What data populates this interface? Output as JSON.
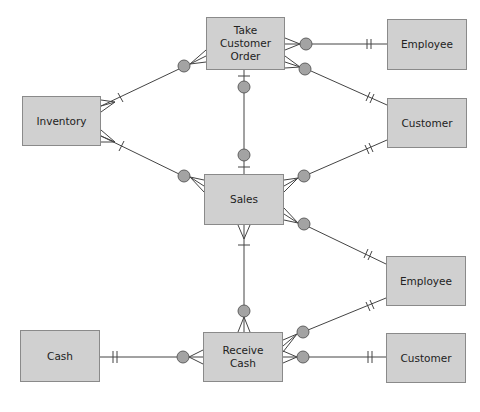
{
  "diagram": {
    "type": "entity-relationship (REA) diagram",
    "entities": [
      {
        "id": "take_customer_order",
        "label": "Take Customer\nOrder",
        "x": 206,
        "y": 17,
        "w": 79,
        "h": 53
      },
      {
        "id": "employee_top",
        "label": "Employee",
        "x": 387,
        "y": 19,
        "w": 80,
        "h": 51
      },
      {
        "id": "customer_top",
        "label": "Customer",
        "x": 387,
        "y": 98,
        "w": 80,
        "h": 50
      },
      {
        "id": "inventory",
        "label": "Inventory",
        "x": 22,
        "y": 96,
        "w": 79,
        "h": 50
      },
      {
        "id": "sales",
        "label": "Sales",
        "x": 204,
        "y": 174,
        "w": 80,
        "h": 51
      },
      {
        "id": "employee_bottom",
        "label": "Employee",
        "x": 386,
        "y": 256,
        "w": 80,
        "h": 50
      },
      {
        "id": "cash",
        "label": "Cash",
        "x": 20,
        "y": 330,
        "w": 80,
        "h": 52
      },
      {
        "id": "receive_cash",
        "label": "Receive\nCash",
        "x": 203,
        "y": 332,
        "w": 80,
        "h": 50
      },
      {
        "id": "customer_bottom",
        "label": "Customer",
        "x": 386,
        "y": 333,
        "w": 80,
        "h": 50
      }
    ],
    "relationships": [
      {
        "from": "take_customer_order",
        "to": "employee_top",
        "from_cardinality": "zero-or-many",
        "to_cardinality": "one-and-only-one"
      },
      {
        "from": "take_customer_order",
        "to": "customer_top",
        "from_cardinality": "zero-or-many",
        "to_cardinality": "one-and-only-one"
      },
      {
        "from": "take_customer_order",
        "to": "inventory",
        "from_cardinality": "zero-or-many",
        "to_cardinality": "one-or-many"
      },
      {
        "from": "take_customer_order",
        "to": "sales",
        "from_cardinality": "zero-or-one",
        "to_cardinality": "zero-or-one"
      },
      {
        "from": "sales",
        "to": "inventory",
        "from_cardinality": "zero-or-many",
        "to_cardinality": "one-or-many"
      },
      {
        "from": "sales",
        "to": "customer_top",
        "from_cardinality": "zero-or-many",
        "to_cardinality": "one-and-only-one"
      },
      {
        "from": "sales",
        "to": "employee_bottom",
        "from_cardinality": "zero-or-many",
        "to_cardinality": "one-and-only-one"
      },
      {
        "from": "sales",
        "to": "receive_cash",
        "from_cardinality": "one-or-many",
        "to_cardinality": "zero-or-many"
      },
      {
        "from": "receive_cash",
        "to": "cash",
        "from_cardinality": "zero-or-many",
        "to_cardinality": "one-and-only-one"
      },
      {
        "from": "receive_cash",
        "to": "employee_bottom",
        "from_cardinality": "zero-or-many",
        "to_cardinality": "one-and-only-one"
      },
      {
        "from": "receive_cash",
        "to": "customer_bottom",
        "from_cardinality": "zero-or-many",
        "to_cardinality": "one-and-only-one"
      }
    ]
  },
  "colors": {
    "entity_fill": "#d0d0d0",
    "entity_border": "#8a8a8a",
    "line": "#444444",
    "circle_fill": "#a3a3a3"
  }
}
